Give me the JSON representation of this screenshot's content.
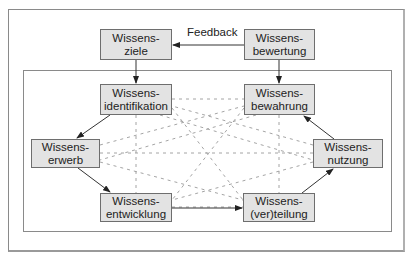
{
  "diagram": {
    "feedback_label": "Feedback",
    "nodes": {
      "ziele": {
        "line1": "Wissens-",
        "line2": "ziele"
      },
      "bewertung": {
        "line1": "Wissens-",
        "line2": "bewertung"
      },
      "identifikation": {
        "line1": "Wissens-",
        "line2": "identifikation"
      },
      "bewahrung": {
        "line1": "Wissens-",
        "line2": "bewahrung"
      },
      "erwerb": {
        "line1": "Wissens-",
        "line2": "erwerb"
      },
      "nutzung": {
        "line1": "Wissens-",
        "line2": "nutzung"
      },
      "entwicklung": {
        "line1": "Wissens-",
        "line2": "entwicklung"
      },
      "verteilung": {
        "line1": "Wissens-",
        "line2": "(ver)teilung"
      }
    },
    "edges": [
      {
        "from": "bewertung",
        "to": "ziele",
        "label": "Feedback",
        "style": "solid"
      },
      {
        "from": "ziele",
        "to": "identifikation",
        "style": "solid"
      },
      {
        "from": "bewertung",
        "to": "bewahrung",
        "style": "solid"
      },
      {
        "from": "identifikation",
        "to": "erwerb",
        "style": "solid"
      },
      {
        "from": "erwerb",
        "to": "entwicklung",
        "style": "solid"
      },
      {
        "from": "entwicklung",
        "to": "verteilung",
        "style": "solid"
      },
      {
        "from": "verteilung",
        "to": "nutzung",
        "style": "solid"
      },
      {
        "from": "nutzung",
        "to": "bewahrung",
        "style": "solid"
      }
    ],
    "colors": {
      "box_fill": "#e3e3e3",
      "box_border": "#6e6e6e",
      "line": "#333333",
      "dashed": "#9a9a9a"
    }
  }
}
